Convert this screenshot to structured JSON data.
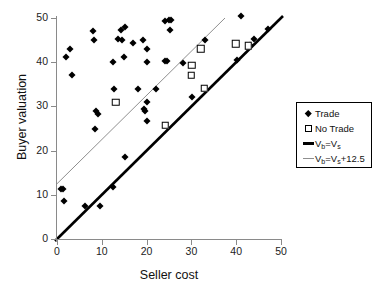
{
  "chart_data": {
    "type": "scatter",
    "title": "",
    "xlabel": "Seller cost",
    "ylabel": "Buyer valuation",
    "xlim": [
      0,
      50
    ],
    "ylim": [
      0,
      50
    ],
    "xticks": [
      0,
      10,
      20,
      30,
      40,
      50
    ],
    "yticks": [
      0,
      10,
      20,
      30,
      40,
      50
    ],
    "grid": false,
    "legend_position": "right",
    "series": [
      {
        "name": "Trade",
        "marker": "filled-diamond",
        "color": "#000000",
        "points": [
          [
            1.0,
            11.2
          ],
          [
            1.4,
            11.3
          ],
          [
            1.6,
            8.7
          ],
          [
            2.0,
            41.2
          ],
          [
            3.0,
            43.0
          ],
          [
            3.4,
            37.0
          ],
          [
            6.2,
            7.5
          ],
          [
            8.0,
            47.0
          ],
          [
            8.2,
            45.0
          ],
          [
            8.4,
            24.8
          ],
          [
            8.8,
            29.0
          ],
          [
            9.2,
            28.2
          ],
          [
            9.6,
            7.4
          ],
          [
            12.6,
            40.0
          ],
          [
            12.8,
            34.0
          ],
          [
            12.4,
            11.8
          ],
          [
            13.6,
            45.2
          ],
          [
            14.2,
            47.2
          ],
          [
            14.6,
            45.0
          ],
          [
            15.2,
            48.0
          ],
          [
            15.0,
            41.2
          ],
          [
            15.2,
            18.6
          ],
          [
            17.0,
            44.3
          ],
          [
            18.0,
            34.0
          ],
          [
            19.2,
            45.0
          ],
          [
            19.4,
            29.4
          ],
          [
            19.6,
            29.0
          ],
          [
            20.0,
            43.0
          ],
          [
            20.0,
            40.0
          ],
          [
            20.2,
            31.0
          ],
          [
            20.2,
            26.8
          ],
          [
            22.0,
            34.0
          ],
          [
            24.0,
            49.3
          ],
          [
            24.2,
            40.2
          ],
          [
            24.6,
            40.3
          ],
          [
            25.0,
            49.5
          ],
          [
            25.4,
            49.5
          ],
          [
            25.2,
            47.2
          ],
          [
            28.2,
            39.8
          ],
          [
            30.2,
            32.2
          ],
          [
            33.0,
            45.0
          ],
          [
            40.2,
            40.4
          ],
          [
            41.0,
            50.5
          ],
          [
            43.0,
            44.0
          ],
          [
            44.0,
            45.3
          ],
          [
            47.2,
            47.5
          ]
        ]
      },
      {
        "name": "No Trade",
        "marker": "open-square",
        "color": "#000000",
        "points": [
          [
            13.0,
            31.0
          ],
          [
            24.0,
            25.8
          ],
          [
            29.8,
            37.2
          ],
          [
            30.0,
            39.4
          ],
          [
            32.0,
            43.2
          ],
          [
            32.8,
            34.2
          ],
          [
            39.8,
            44.3
          ],
          [
            42.6,
            43.8
          ]
        ]
      }
    ],
    "reference_lines": [
      {
        "name": "Vb=Vs",
        "label_html": "V<sub>b</sub>=V<sub>s</sub>",
        "slope": 1,
        "intercept": 0,
        "color": "#000000",
        "width": 2.6,
        "style": "thick"
      },
      {
        "name": "Vb=Vs+12.5",
        "label_html": "V<sub>b</sub>=V<sub>s</sub>+12.5",
        "slope": 1,
        "intercept": 12.5,
        "color": "#8f8f8f",
        "width": 1,
        "style": "thin"
      }
    ]
  },
  "legend": {
    "items": [
      {
        "label": "Trade",
        "key": "filled-diamond"
      },
      {
        "label": "No Trade",
        "key": "open-square"
      },
      {
        "label": "Vb=Vs",
        "key": "thick-line"
      },
      {
        "label": "Vb=Vs+12.5",
        "key": "thin-line"
      }
    ]
  },
  "axes": {
    "x_title": "Seller cost",
    "y_title": "Buyer valuation",
    "x_tick_labels": [
      "0",
      "10",
      "20",
      "30",
      "40",
      "50"
    ],
    "y_tick_labels": [
      "0",
      "10",
      "20",
      "30",
      "40",
      "50"
    ]
  }
}
